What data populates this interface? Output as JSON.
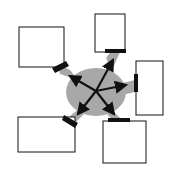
{
  "diagram": {
    "type": "hub-and-spoke",
    "colors": {
      "background": "#ffffff",
      "hub": "#a8a8a8",
      "arrow": "#111111",
      "box_fill": "#ffffff",
      "box_stroke": "#111111",
      "connector": "#111111"
    },
    "hub": {
      "cx": 96,
      "cy": 91
    },
    "boxes": [
      {
        "id": "top-left",
        "label": ""
      },
      {
        "id": "top-right",
        "label": ""
      },
      {
        "id": "right",
        "label": ""
      },
      {
        "id": "bottom-left",
        "label": ""
      },
      {
        "id": "bottom-right",
        "label": ""
      }
    ]
  }
}
